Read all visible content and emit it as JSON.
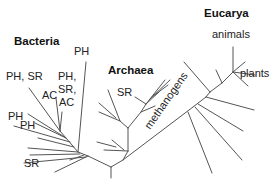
{
  "diagram": {
    "type": "phylogenetic-tree",
    "domains": [
      {
        "name": "Bacteria",
        "x": 14,
        "y": 45
      },
      {
        "name": "Archaea",
        "x": 108,
        "y": 74
      },
      {
        "name": "Eucarya",
        "x": 204,
        "y": 17
      }
    ],
    "leaf_labels": [
      {
        "text": "PH",
        "x": 74,
        "y": 55,
        "group": "Bacteria"
      },
      {
        "text": "PH, SR",
        "x": 6,
        "y": 80,
        "group": "Bacteria"
      },
      {
        "text": "PH,",
        "x": 58,
        "y": 80,
        "group": "Bacteria"
      },
      {
        "text": "SR,",
        "x": 58,
        "y": 93,
        "group": "Bacteria"
      },
      {
        "text": "AC",
        "x": 42,
        "y": 99,
        "group": "Bacteria"
      },
      {
        "text": "AC",
        "x": 59,
        "y": 106,
        "group": "Bacteria"
      },
      {
        "text": "PH",
        "x": 8,
        "y": 120,
        "group": "Bacteria"
      },
      {
        "text": "PH",
        "x": 20,
        "y": 129,
        "group": "Bacteria"
      },
      {
        "text": "SR",
        "x": 24,
        "y": 167,
        "group": "Bacteria"
      },
      {
        "text": "SR",
        "x": 117,
        "y": 96,
        "group": "Archaea"
      },
      {
        "text": "animals",
        "x": 212,
        "y": 38,
        "group": "Eucarya"
      },
      {
        "text": "plants",
        "x": 240,
        "y": 77,
        "group": "Eucarya"
      }
    ],
    "rotated_labels": [
      {
        "text": "methanogens",
        "x": 150,
        "y": 130,
        "angle": -55,
        "group": "Archaea"
      }
    ],
    "branches": [
      [
        111,
        178,
        111,
        167
      ],
      [
        111,
        167,
        88,
        156
      ],
      [
        111,
        167,
        123,
        160
      ],
      [
        88,
        156,
        78,
        152
      ],
      [
        78,
        152,
        66,
        138
      ],
      [
        66,
        138,
        60,
        131
      ],
      [
        60,
        131,
        29,
        88
      ],
      [
        60,
        131,
        56,
        98
      ],
      [
        60,
        131,
        62,
        112
      ],
      [
        66,
        138,
        28,
        114
      ],
      [
        66,
        138,
        35,
        123
      ],
      [
        70,
        142,
        14,
        126
      ],
      [
        74,
        147,
        38,
        138
      ],
      [
        78,
        152,
        28,
        148
      ],
      [
        78,
        152,
        86,
        62
      ],
      [
        80,
        154,
        30,
        155
      ],
      [
        84,
        155,
        70,
        160
      ],
      [
        86,
        157,
        24,
        163
      ],
      [
        88,
        156,
        55,
        172
      ],
      [
        123,
        160,
        128,
        151
      ],
      [
        128,
        151,
        128,
        128
      ],
      [
        128,
        151,
        104,
        150
      ],
      [
        124,
        150,
        112,
        140
      ],
      [
        116,
        147,
        97,
        142
      ],
      [
        128,
        128,
        120,
        121
      ],
      [
        120,
        121,
        108,
        90
      ],
      [
        120,
        121,
        99,
        112
      ],
      [
        116,
        118,
        99,
        103
      ],
      [
        128,
        128,
        141,
        112
      ],
      [
        141,
        112,
        146,
        104
      ],
      [
        146,
        104,
        159,
        92
      ],
      [
        146,
        104,
        135,
        97
      ],
      [
        141,
        112,
        155,
        106
      ],
      [
        146,
        104,
        165,
        80
      ],
      [
        150,
        99,
        170,
        80
      ],
      [
        152,
        97,
        168,
        85
      ],
      [
        123,
        160,
        193,
        107
      ],
      [
        193,
        107,
        206,
        97
      ],
      [
        206,
        97,
        210,
        92
      ],
      [
        210,
        92,
        184,
        62
      ],
      [
        210,
        92,
        222,
        83
      ],
      [
        222,
        83,
        216,
        70
      ],
      [
        222,
        83,
        233,
        72
      ],
      [
        233,
        72,
        233,
        47
      ],
      [
        233,
        72,
        245,
        62
      ],
      [
        233,
        72,
        255,
        75
      ],
      [
        233,
        72,
        248,
        86
      ],
      [
        206,
        97,
        254,
        110
      ],
      [
        198,
        104,
        243,
        131
      ],
      [
        195,
        107,
        242,
        160
      ],
      [
        188,
        112,
        212,
        173
      ]
    ]
  }
}
